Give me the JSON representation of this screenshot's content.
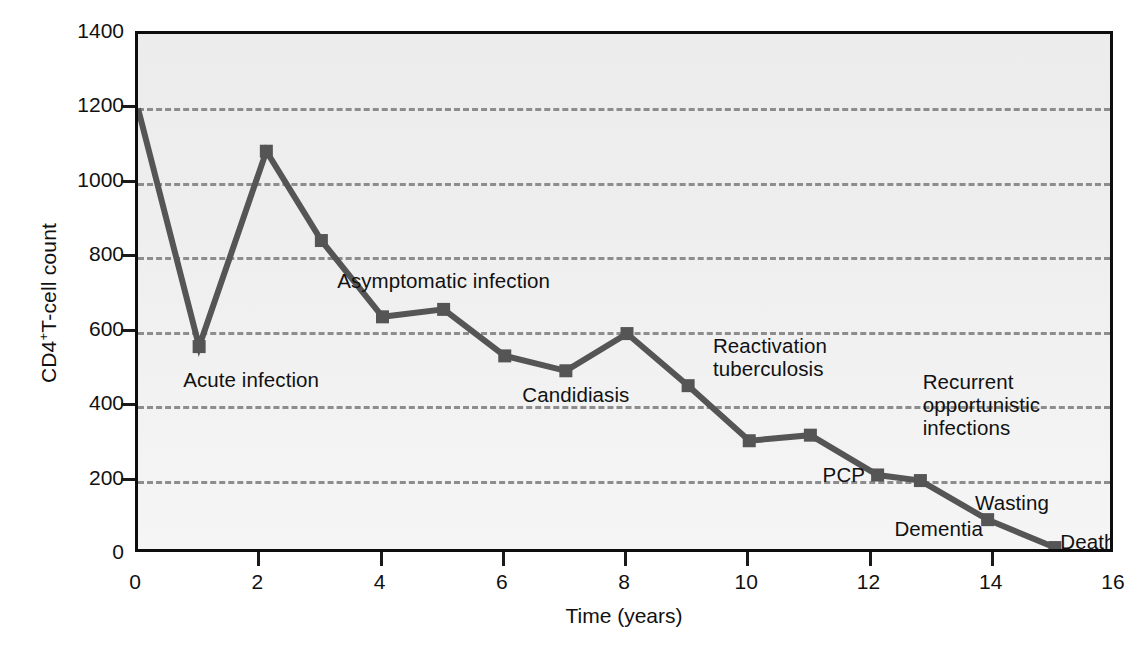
{
  "chart_data": {
    "type": "line",
    "title": "",
    "xlabel": "Time (years)",
    "ylabel": "CD4+T-cell count",
    "ylabel_prefix": "CD4",
    "ylabel_sup": "+",
    "ylabel_suffix": "T-cell count",
    "xlim": [
      0,
      16
    ],
    "ylim": [
      0,
      1400
    ],
    "xticks": [
      0,
      2,
      4,
      6,
      8,
      10,
      12,
      14,
      16
    ],
    "yticks": [
      0,
      200,
      400,
      600,
      800,
      1000,
      1200,
      1400
    ],
    "gridlines_y": [
      200,
      400,
      600,
      800,
      1000,
      1200
    ],
    "grid": true,
    "legend": "none",
    "series": [
      {
        "name": "CD4+ T-cell count",
        "color": "#555555",
        "marker": "square",
        "x": [
          0,
          1.0,
          2.1,
          3.0,
          4.0,
          5.0,
          6.0,
          7.0,
          8.0,
          9.0,
          10.0,
          11.0,
          12.1,
          12.8,
          13.9,
          15.0
        ],
        "y": [
          1200,
          560,
          1085,
          845,
          640,
          660,
          535,
          495,
          595,
          455,
          307,
          322,
          215,
          200,
          95,
          20
        ]
      }
    ],
    "annotations": [
      {
        "id": "acute-infection",
        "text": "Acute infection",
        "x": 1.0,
        "y": 470
      },
      {
        "id": "asymptomatic-infection",
        "text": "Asymptomatic infection",
        "x": 5.0,
        "y": 735
      },
      {
        "id": "candidiasis",
        "text": "Candidiasis",
        "x": 7.0,
        "y": 430
      },
      {
        "id": "reactivation-tuberculosis",
        "text": "Reactivation\ntuberculosis",
        "x": 9.7,
        "y": 530
      },
      {
        "id": "recurrent-opportunistic-infections",
        "text": "Recurrent\nopportunistic\ninfections",
        "x": 13.0,
        "y": 400
      },
      {
        "id": "pcp",
        "text": "PCP",
        "x": 11.6,
        "y": 215
      },
      {
        "id": "wasting",
        "text": "Wasting",
        "x": 14.2,
        "y": 140
      },
      {
        "id": "dementia",
        "text": "Dementia",
        "x": 13.1,
        "y": 70
      },
      {
        "id": "death",
        "text": "Death",
        "x": 15.6,
        "y": 35
      }
    ]
  },
  "axis": {
    "y_tick_labels": [
      "1400",
      "1200",
      "1000",
      "800",
      "600",
      "400",
      "200",
      "0"
    ],
    "x_tick_labels": [
      "0",
      "2",
      "4",
      "6",
      "8",
      "10",
      "12",
      "14",
      "16"
    ],
    "x_title": "Time (years)"
  },
  "annotations_text": {
    "acute_infection": "Acute infection",
    "asymptomatic_infection": "Asymptomatic infection",
    "candidiasis": "Candidiasis",
    "reactivation_tuberculosis_line1": "Reactivation",
    "reactivation_tuberculosis_line2": "tuberculosis",
    "recurrent_line1": "Recurrent",
    "recurrent_line2": "opportunistic",
    "recurrent_line3": "infections",
    "pcp": "PCP",
    "wasting": "Wasting",
    "dementia": "Dementia",
    "death": "Death"
  },
  "colors": {
    "series_line": "#555555",
    "plot_border": "#0d0d0d",
    "gridline": "#8d8d8d",
    "plot_background_top": "#ececec",
    "plot_background_bottom": "#f5f5f5",
    "text": "#111111"
  }
}
